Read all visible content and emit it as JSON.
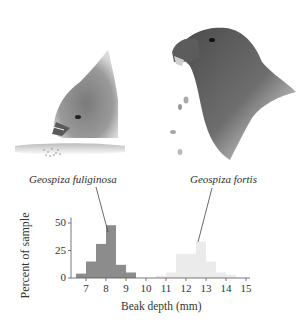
{
  "illustration": {
    "left_bird": "Geospiza fuliginosa head pecking at ground seeds",
    "right_bird": "Geospiza fortis head cracking seeds"
  },
  "labels": {
    "species_small": "Geospiza fuliginosa",
    "species_large": "Geospiza fortis"
  },
  "colors": {
    "fuliginosa_bar": "#8c8c8c",
    "fortis_bar": "#ebebeb",
    "axis": "#555555",
    "pointer": "#444444"
  },
  "chart_data": {
    "type": "bar",
    "title": "",
    "xlabel": "Beak depth (mm)",
    "ylabel": "Percent of sample",
    "xlim": [
      6.5,
      15.2
    ],
    "ylim": [
      0,
      55
    ],
    "xticks": [
      7,
      8,
      9,
      10,
      11,
      12,
      13,
      14,
      15
    ],
    "yticks": [
      0,
      25,
      50
    ],
    "grid": false,
    "legend": "none (species labeled with pointer lines)",
    "bin_width": 0.5,
    "series": [
      {
        "name": "Geospiza fuliginosa",
        "bins": [
          6.5,
          7.0,
          7.5,
          8.0,
          8.5,
          9.0
        ],
        "values": [
          4,
          15,
          31,
          48,
          12,
          5
        ]
      },
      {
        "name": "Geospiza fortis",
        "bins": [
          10.5,
          11.0,
          11.5,
          12.0,
          12.5,
          13.0,
          13.5,
          14.0
        ],
        "values": [
          2,
          5,
          22,
          22,
          33,
          15,
          5,
          3
        ]
      }
    ]
  }
}
